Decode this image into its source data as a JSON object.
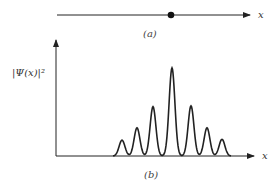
{
  "panel_a": {
    "caption": "(a)",
    "axis_label": "x",
    "line": {
      "x1": 57,
      "x2": 250,
      "y": 15
    },
    "particle": {
      "x": 171,
      "y": 15,
      "r": 3.3
    }
  },
  "panel_b": {
    "caption": "(b)",
    "x_axis_label": "x",
    "y_axis_label": "|Ψ(x)|²",
    "origin": {
      "x": 56,
      "y": 156
    },
    "y_axis_top": 40,
    "x_axis_end": 254
  },
  "chart_data": {
    "type": "line",
    "title": "",
    "xlabel": "x",
    "ylabel": "|Ψ(x)|²",
    "peaks_x_px": [
      122,
      137,
      153,
      172,
      191,
      207,
      222
    ],
    "peaks_relative_height": [
      0.18,
      0.32,
      0.56,
      1.0,
      0.57,
      0.32,
      0.19
    ],
    "baseline_y_px": 156,
    "max_height_px": 88
  },
  "colors": {
    "stroke": "#222222",
    "text": "#333333"
  }
}
